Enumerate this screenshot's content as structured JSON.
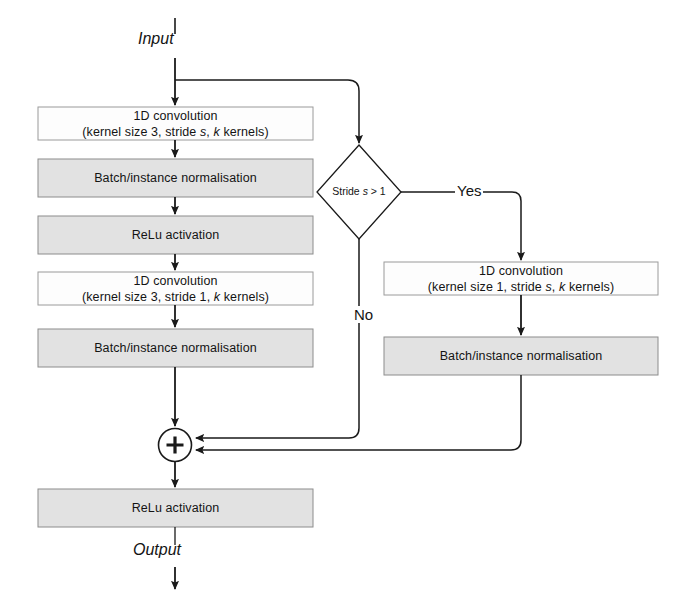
{
  "diagram": {
    "colors": {
      "box_fill_light": "#fdfdfd",
      "box_fill_gray": "#e0e0e0",
      "box_stroke": "#8c8c8c",
      "line": "#1a1a1a",
      "text": "#141414",
      "background": "#ffffff"
    },
    "io": {
      "input_label": "Input",
      "output_label": "Output"
    },
    "main_nodes": [
      {
        "id": "conv1",
        "line1": "1D convolution",
        "line2_prefix": "(kernel size 3, stride ",
        "line2_var1": "s",
        "line2_mid": ", ",
        "line2_var2": "k",
        "line2_suffix": " kernels)",
        "fill": "light"
      },
      {
        "id": "norm1",
        "line1": "Batch/instance normalisation",
        "fill": "gray"
      },
      {
        "id": "relu1",
        "line1": "ReLu activation",
        "fill": "gray"
      },
      {
        "id": "conv2",
        "line1": "1D convolution",
        "line2_prefix": "(kernel size 3, stride 1, ",
        "line2_var2": "k",
        "line2_suffix": " kernels)",
        "fill": "light"
      },
      {
        "id": "norm2",
        "line1": "Batch/instance normalisation",
        "fill": "gray"
      },
      {
        "id": "relu2",
        "line1": "ReLu activation",
        "fill": "gray"
      }
    ],
    "shortcut_nodes": [
      {
        "id": "conv_shortcut",
        "line1": "1D convolution",
        "line2_prefix": "(kernel size 1, stride ",
        "line2_var1": "s",
        "line2_mid": ", ",
        "line2_var2": "k",
        "line2_suffix": " kernels)",
        "fill": "light"
      },
      {
        "id": "norm_shortcut",
        "line1": "Batch/instance normalisation",
        "fill": "gray"
      }
    ],
    "decision": {
      "id": "stride-check",
      "text_prefix": "Stride ",
      "text_var": "s",
      "text_suffix": " > 1",
      "branch_yes": "Yes",
      "branch_no": "No"
    },
    "merge": {
      "id": "add-operator",
      "symbol": "+"
    }
  }
}
